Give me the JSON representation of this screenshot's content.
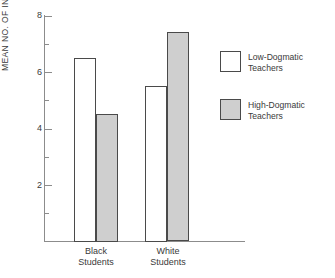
{
  "chart_data": {
    "type": "bar",
    "title": "",
    "xlabel": "",
    "ylabel": "MEAN NO. OF INTERACTIONS",
    "ylim": [
      0,
      8
    ],
    "ytick_labels": [
      "8",
      "6",
      "4",
      "2"
    ],
    "ytick_values": [
      8,
      6,
      4,
      2
    ],
    "minor_tick_values": [
      7,
      5,
      3,
      1
    ],
    "grid": false,
    "legend_position": "right",
    "categories": [
      "Black\nStudents",
      "White\nStudents"
    ],
    "category_lines": [
      {
        "line1": "Black",
        "line2": "Students"
      },
      {
        "line1": "White",
        "line2": "Students"
      }
    ],
    "series": [
      {
        "name": "Low-Dogmatic\nTeachers",
        "values": [
          6.5,
          5.5
        ],
        "color": "#ffffff"
      },
      {
        "name": "High-Dogmatic\nTeachers",
        "values": [
          4.5,
          7.4
        ],
        "color": "#cfcfcf"
      }
    ]
  },
  "legend": {
    "items": [
      {
        "label": "Low-Dogmatic\nTeachers",
        "swatch": "white-square"
      },
      {
        "label": "High-Dogmatic\nTeachers",
        "swatch": "gray-square"
      }
    ]
  },
  "colors": {
    "low_dogmatic_fill": "#ffffff",
    "high_dogmatic_fill": "#cfcfcf",
    "bar_outline": "#4a4a4a",
    "axis": "#8c8c8c",
    "text": "#3a3a3a"
  }
}
